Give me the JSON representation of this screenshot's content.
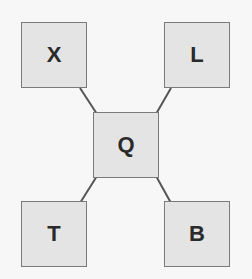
{
  "diagram": {
    "nodes": [
      {
        "id": "X",
        "label": "X",
        "x": 21,
        "y": 22
      },
      {
        "id": "L",
        "label": "L",
        "x": 164,
        "y": 22
      },
      {
        "id": "Q",
        "label": "Q",
        "x": 93,
        "y": 112
      },
      {
        "id": "T",
        "label": "T",
        "x": 21,
        "y": 201
      },
      {
        "id": "B",
        "label": "B",
        "x": 164,
        "y": 201
      }
    ],
    "edges": [
      [
        "X",
        "Q"
      ],
      [
        "L",
        "Q"
      ],
      [
        "T",
        "Q"
      ],
      [
        "B",
        "Q"
      ]
    ],
    "colors": {
      "node_fill": "#e4e4e4",
      "node_border": "#7a7a7a",
      "edge": "#555555",
      "background": "#f7f7f7"
    }
  }
}
